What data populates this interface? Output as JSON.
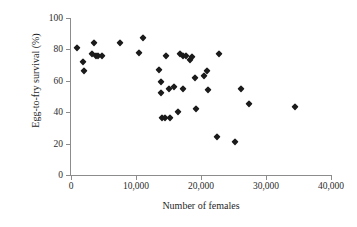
{
  "chart_data": {
    "type": "scatter",
    "title": "",
    "xlabel": "Number of females",
    "ylabel": "Egg-to-fry survival (%)",
    "xlim": [
      0,
      40000
    ],
    "ylim": [
      0,
      100
    ],
    "xticks": [
      0,
      10000,
      20000,
      30000,
      40000
    ],
    "xticklabels": [
      "0",
      "10,000",
      "20,000",
      "30,000",
      "40,000"
    ],
    "yticks": [
      0,
      20,
      40,
      60,
      80,
      100
    ],
    "yticklabels": [
      "0",
      "20",
      "40",
      "60",
      "80",
      "100"
    ],
    "grid": false,
    "legend": null,
    "marker": "filled-diamond",
    "marker_color": "#1b1b1b",
    "axis_color": "#8c8c8c",
    "series": [
      {
        "name": "Egg-to-fry survival vs number of females",
        "points": [
          [
            900,
            81
          ],
          [
            1900,
            72
          ],
          [
            2000,
            66
          ],
          [
            3300,
            77
          ],
          [
            3600,
            84
          ],
          [
            3800,
            76
          ],
          [
            4100,
            76
          ],
          [
            4700,
            76
          ],
          [
            7600,
            84
          ],
          [
            10400,
            78
          ],
          [
            11100,
            87
          ],
          [
            13600,
            67
          ],
          [
            13800,
            59
          ],
          [
            13900,
            52
          ],
          [
            14000,
            36
          ],
          [
            14400,
            36
          ],
          [
            14600,
            76
          ],
          [
            15000,
            55
          ],
          [
            15200,
            36
          ],
          [
            15900,
            56
          ],
          [
            16400,
            40
          ],
          [
            16800,
            77
          ],
          [
            17200,
            76
          ],
          [
            17300,
            55
          ],
          [
            17700,
            76
          ],
          [
            18300,
            73
          ],
          [
            18600,
            75
          ],
          [
            19000,
            62
          ],
          [
            19300,
            42
          ],
          [
            20400,
            63
          ],
          [
            20900,
            66
          ],
          [
            21100,
            54
          ],
          [
            22400,
            24
          ],
          [
            22800,
            77
          ],
          [
            25300,
            21
          ],
          [
            26100,
            55
          ],
          [
            27400,
            45
          ],
          [
            34500,
            43
          ]
        ]
      }
    ]
  },
  "axes": {
    "y_title": "Egg-to-fry survival (%)",
    "x_title": "Number of females"
  }
}
